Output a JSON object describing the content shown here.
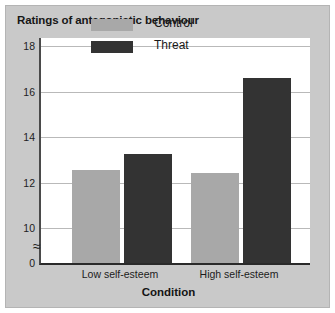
{
  "chart_data": {
    "type": "bar",
    "title": "Ratings of antagonistic behaviour",
    "xlabel": "Condition",
    "ylabel": "",
    "categories": [
      "Low self-esteem",
      "High self-esteem"
    ],
    "series": [
      {
        "name": "Control",
        "color": "#a8a8a8",
        "values": [
          12.55,
          12.4
        ]
      },
      {
        "name": "Threat",
        "color": "#333333",
        "values": [
          13.25,
          16.6
        ]
      }
    ],
    "ylim": [
      10,
      18
    ],
    "yticks": [
      18,
      16,
      14,
      12,
      10,
      0
    ],
    "ytick_labels": [
      "18",
      "16",
      "14",
      "12",
      "10",
      "0"
    ],
    "axis_break": true,
    "axis_break_symbol": "≈",
    "grid": true,
    "legend_position": "upper center"
  },
  "figure": {
    "background": "#c9c9c9",
    "plot_background": "#ffffff",
    "gridline_color": "#b9b9b9",
    "axis_color": "#2a2a2a"
  }
}
